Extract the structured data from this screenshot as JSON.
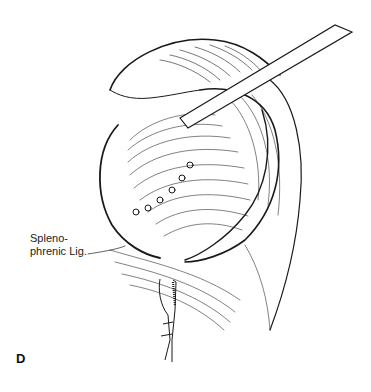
{
  "figure": {
    "panel_letter": "D",
    "labels": [
      {
        "id": "splenophrenic",
        "line1": "Spleno-",
        "line2": "phrenic Lig."
      }
    ],
    "colors": {
      "ink": "#1a1a1a",
      "background": "#ffffff"
    }
  }
}
